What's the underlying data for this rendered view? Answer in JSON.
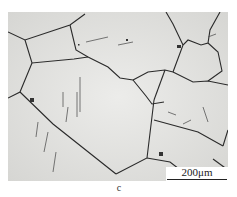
{
  "figure": {
    "panel_label": "c",
    "scale_bar": {
      "label": "200μm"
    }
  },
  "colors": {
    "background": "#e4e4e2",
    "boundary": "#2a2a2a"
  }
}
